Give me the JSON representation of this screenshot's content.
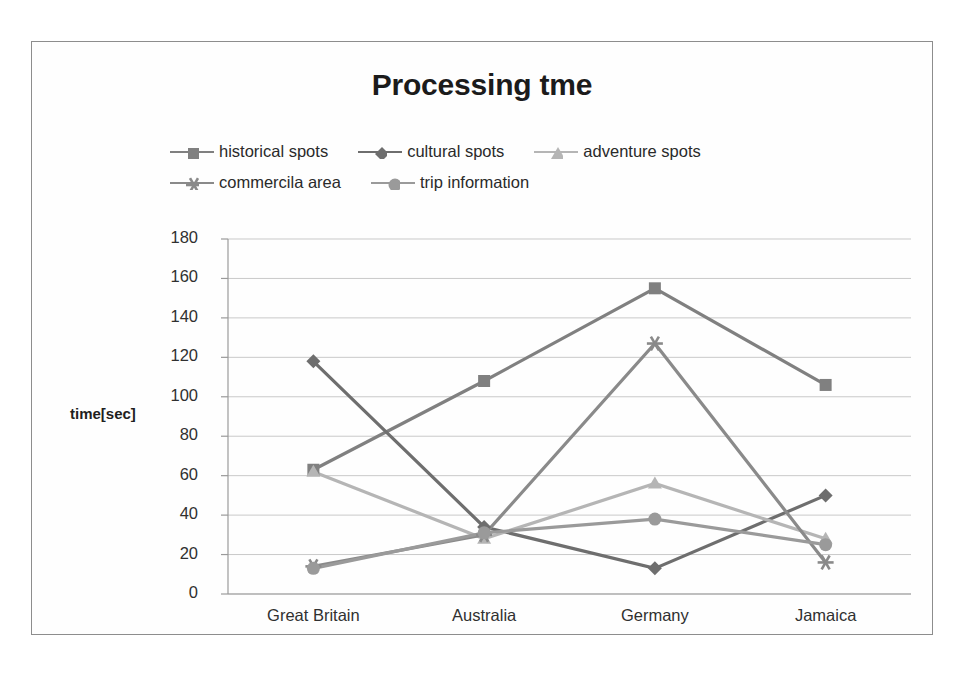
{
  "chart_data": {
    "type": "line",
    "title": "Processing tme",
    "xlabel": "",
    "ylabel": "time[sec]",
    "categories": [
      "Great Britain",
      "Australia",
      "Germany",
      "Jamaica"
    ],
    "ylim": [
      0,
      180
    ],
    "yticks": [
      180,
      160,
      140,
      120,
      100,
      80,
      60,
      40,
      20,
      0
    ],
    "grid": true,
    "legend_position": "top",
    "series": [
      {
        "name": "historical spots",
        "marker": "square",
        "color": "#808080",
        "values": [
          63,
          108,
          155,
          106
        ]
      },
      {
        "name": "cultural spots",
        "marker": "diamond",
        "color": "#6e6e6e",
        "values": [
          118,
          34,
          13,
          50
        ]
      },
      {
        "name": "adventure spots",
        "marker": "triangle",
        "color": "#b5b5b5",
        "values": [
          62,
          28,
          56,
          28
        ]
      },
      {
        "name": "commercila area",
        "marker": "asterisk",
        "color": "#8a8a8a",
        "values": [
          14,
          30,
          127,
          16
        ]
      },
      {
        "name": "trip information",
        "marker": "circle",
        "color": "#9a9a9a",
        "values": [
          13,
          31,
          38,
          25
        ]
      }
    ]
  },
  "legend_rows": [
    [
      0,
      1,
      2
    ],
    [
      3,
      4
    ]
  ],
  "frame": {
    "border_color": "#8d8d8d",
    "background": "#fefefe",
    "grid_color": "#c9c9c9",
    "axis_color": "#9a9a9a"
  }
}
